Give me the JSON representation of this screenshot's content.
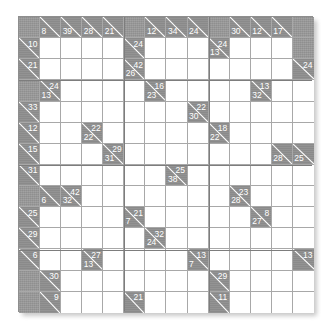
{
  "puzzle": {
    "title": "Kakuro Grid",
    "type": "kakuro",
    "rows": 14,
    "cols": 14,
    "colors": {
      "block": "#8f8f8f",
      "clue": "#8a8a8a",
      "open": "#ffffff",
      "grid_line": "#a8a8a8",
      "border": "#8e8e8e",
      "clue_text": "#ffffff"
    },
    "cells": [
      [
        {
          "t": "block"
        },
        {
          "t": "clue",
          "down": "8"
        },
        {
          "t": "clue",
          "down": "39"
        },
        {
          "t": "clue",
          "down": "28"
        },
        {
          "t": "clue",
          "down": "21"
        },
        {
          "t": "block"
        },
        {
          "t": "clue",
          "down": "12"
        },
        {
          "t": "clue",
          "down": "34"
        },
        {
          "t": "clue",
          "down": "24"
        },
        {
          "t": "block"
        },
        {
          "t": "clue",
          "down": "30"
        },
        {
          "t": "clue",
          "down": "12"
        },
        {
          "t": "clue",
          "down": "17"
        },
        {
          "t": "block"
        }
      ],
      [
        {
          "t": "clue",
          "across": "10"
        },
        {
          "t": "open"
        },
        {
          "t": "open"
        },
        {
          "t": "open"
        },
        {
          "t": "open"
        },
        {
          "t": "clue",
          "across": "24"
        },
        {
          "t": "open"
        },
        {
          "t": "open"
        },
        {
          "t": "open"
        },
        {
          "t": "clue",
          "across": "24",
          "down": "13"
        },
        {
          "t": "open"
        },
        {
          "t": "open"
        },
        {
          "t": "open"
        },
        {
          "t": "block"
        }
      ],
      [
        {
          "t": "clue",
          "across": "21"
        },
        {
          "t": "open"
        },
        {
          "t": "open"
        },
        {
          "t": "open"
        },
        {
          "t": "open"
        },
        {
          "t": "clue",
          "across": "42",
          "down": "26"
        },
        {
          "t": "open"
        },
        {
          "t": "open"
        },
        {
          "t": "open"
        },
        {
          "t": "open"
        },
        {
          "t": "open"
        },
        {
          "t": "open"
        },
        {
          "t": "open"
        },
        {
          "t": "clue",
          "across": "24"
        }
      ],
      [
        {
          "t": "block"
        },
        {
          "t": "clue",
          "across": "24",
          "down": "13"
        },
        {
          "t": "open"
        },
        {
          "t": "open"
        },
        {
          "t": "open"
        },
        {
          "t": "open"
        },
        {
          "t": "clue",
          "across": "16",
          "down": "23"
        },
        {
          "t": "open"
        },
        {
          "t": "open"
        },
        {
          "t": "open"
        },
        {
          "t": "open"
        },
        {
          "t": "clue",
          "across": "13",
          "down": "32"
        },
        {
          "t": "open"
        },
        {
          "t": "open"
        }
      ],
      [
        {
          "t": "clue",
          "across": "33"
        },
        {
          "t": "open"
        },
        {
          "t": "open"
        },
        {
          "t": "open"
        },
        {
          "t": "open"
        },
        {
          "t": "open"
        },
        {
          "t": "open"
        },
        {
          "t": "open"
        },
        {
          "t": "clue",
          "across": "22",
          "down": "30"
        },
        {
          "t": "open"
        },
        {
          "t": "open"
        },
        {
          "t": "open"
        },
        {
          "t": "open"
        },
        {
          "t": "open"
        }
      ],
      [
        {
          "t": "clue",
          "across": "12"
        },
        {
          "t": "open"
        },
        {
          "t": "open"
        },
        {
          "t": "clue",
          "across": "22",
          "down": "22"
        },
        {
          "t": "open"
        },
        {
          "t": "open"
        },
        {
          "t": "open"
        },
        {
          "t": "open"
        },
        {
          "t": "open"
        },
        {
          "t": "clue",
          "across": "18",
          "down": "22"
        },
        {
          "t": "open"
        },
        {
          "t": "open"
        },
        {
          "t": "open"
        },
        {
          "t": "open"
        }
      ],
      [
        {
          "t": "clue",
          "across": "15"
        },
        {
          "t": "open"
        },
        {
          "t": "open"
        },
        {
          "t": "open"
        },
        {
          "t": "clue",
          "across": "29",
          "down": "31"
        },
        {
          "t": "open"
        },
        {
          "t": "open"
        },
        {
          "t": "open"
        },
        {
          "t": "open"
        },
        {
          "t": "open"
        },
        {
          "t": "open"
        },
        {
          "t": "open"
        },
        {
          "t": "clue",
          "down": "28"
        },
        {
          "t": "clue",
          "down": "25"
        }
      ],
      [
        {
          "t": "clue",
          "across": "31"
        },
        {
          "t": "open"
        },
        {
          "t": "open"
        },
        {
          "t": "open"
        },
        {
          "t": "open"
        },
        {
          "t": "open"
        },
        {
          "t": "open"
        },
        {
          "t": "clue",
          "across": "25",
          "down": "38"
        },
        {
          "t": "open"
        },
        {
          "t": "open"
        },
        {
          "t": "open"
        },
        {
          "t": "open"
        },
        {
          "t": "open"
        },
        {
          "t": "open"
        }
      ],
      [
        {
          "t": "block"
        },
        {
          "t": "clue",
          "down": "6"
        },
        {
          "t": "clue",
          "across": "42",
          "down": "32"
        },
        {
          "t": "open"
        },
        {
          "t": "open"
        },
        {
          "t": "open"
        },
        {
          "t": "open"
        },
        {
          "t": "open"
        },
        {
          "t": "open"
        },
        {
          "t": "open"
        },
        {
          "t": "clue",
          "across": "23",
          "down": "28"
        },
        {
          "t": "open"
        },
        {
          "t": "open"
        },
        {
          "t": "open"
        }
      ],
      [
        {
          "t": "clue",
          "across": "25"
        },
        {
          "t": "open"
        },
        {
          "t": "open"
        },
        {
          "t": "open"
        },
        {
          "t": "open"
        },
        {
          "t": "clue",
          "across": "21",
          "down": "7"
        },
        {
          "t": "open"
        },
        {
          "t": "open"
        },
        {
          "t": "open"
        },
        {
          "t": "open"
        },
        {
          "t": "open"
        },
        {
          "t": "clue",
          "across": "8",
          "down": "27"
        },
        {
          "t": "open"
        },
        {
          "t": "open"
        }
      ],
      [
        {
          "t": "clue",
          "across": "29"
        },
        {
          "t": "open"
        },
        {
          "t": "open"
        },
        {
          "t": "open"
        },
        {
          "t": "open"
        },
        {
          "t": "open"
        },
        {
          "t": "clue",
          "across": "32",
          "down": "24"
        },
        {
          "t": "open"
        },
        {
          "t": "open"
        },
        {
          "t": "open"
        },
        {
          "t": "open"
        },
        {
          "t": "open"
        },
        {
          "t": "open"
        },
        {
          "t": "open"
        }
      ],
      [
        {
          "t": "clue",
          "across": "6"
        },
        {
          "t": "open"
        },
        {
          "t": "open"
        },
        {
          "t": "clue",
          "across": "27",
          "down": "13"
        },
        {
          "t": "open"
        },
        {
          "t": "open"
        },
        {
          "t": "open"
        },
        {
          "t": "open"
        },
        {
          "t": "clue",
          "across": "13",
          "down": "7"
        },
        {
          "t": "open"
        },
        {
          "t": "open"
        },
        {
          "t": "open"
        },
        {
          "t": "open"
        },
        {
          "t": "clue",
          "across": "13"
        }
      ],
      [
        {
          "t": "block"
        },
        {
          "t": "clue",
          "across": "30"
        },
        {
          "t": "open"
        },
        {
          "t": "open"
        },
        {
          "t": "open"
        },
        {
          "t": "open"
        },
        {
          "t": "open"
        },
        {
          "t": "open"
        },
        {
          "t": "open"
        },
        {
          "t": "clue",
          "across": "29"
        },
        {
          "t": "open"
        },
        {
          "t": "open"
        },
        {
          "t": "open"
        },
        {
          "t": "open"
        }
      ],
      [
        {
          "t": "block"
        },
        {
          "t": "clue",
          "across": "9"
        },
        {
          "t": "open"
        },
        {
          "t": "open"
        },
        {
          "t": "open"
        },
        {
          "t": "clue",
          "across": "21"
        },
        {
          "t": "open"
        },
        {
          "t": "open"
        },
        {
          "t": "open"
        },
        {
          "t": "clue",
          "across": "11"
        },
        {
          "t": "open"
        },
        {
          "t": "open"
        },
        {
          "t": "open"
        },
        {
          "t": "open"
        }
      ]
    ]
  }
}
